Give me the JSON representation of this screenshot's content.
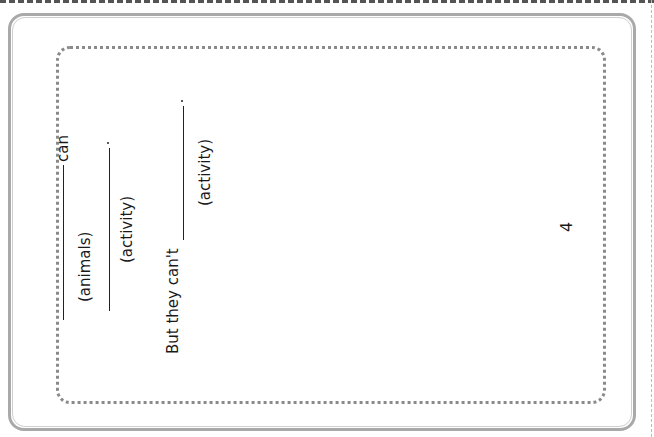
{
  "worksheet": {
    "page_number": "4",
    "line1": {
      "suffix": "can",
      "blank_label": "(animals)"
    },
    "line2": {
      "blank_label": "(activity)",
      "end_punct": "."
    },
    "line3": {
      "prefix": "But they can't",
      "blank_label": "(activity)",
      "end_punct": "."
    }
  },
  "colors": {
    "frame": "#a9a9a9",
    "dotted_border": "#8a8a8a",
    "text": "#1a1a1a"
  }
}
